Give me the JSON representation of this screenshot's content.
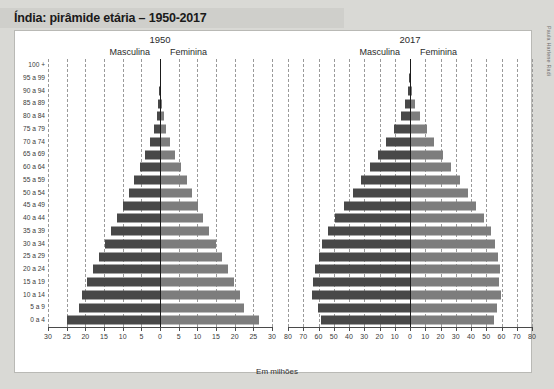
{
  "header": {
    "title": "Índia: pirâmide etária – 1950-2017"
  },
  "credit": "Paula Harlene Radi",
  "footer": {
    "unit_label": "Em milhões"
  },
  "labels": {
    "male": "Masculina",
    "female": "Feminina"
  },
  "colors": {
    "male_bar": "#484848",
    "female_bar": "#7d7d7d",
    "axis": "#1b1b1b",
    "grid": "#9a9a9a",
    "title_band": "#cfcfcb",
    "page_background": "#d9d9d5",
    "plot_background": "#ffffff"
  },
  "chart_data": [
    {
      "type": "bar",
      "title": "1950",
      "subtype": "population-pyramid",
      "xlabel": "Em milhões",
      "ylabel": "",
      "unit": "milhões",
      "xlim": [
        -30,
        30
      ],
      "xticks": [
        30,
        25,
        20,
        15,
        10,
        5,
        0,
        5,
        10,
        15,
        20,
        25,
        30
      ],
      "grid": true,
      "grid_orientation": "vertical",
      "legend_position": "top",
      "categories": [
        "100 +",
        "95 a 99",
        "90 a 94",
        "85 a 89",
        "80 a 84",
        "75 a 79",
        "70 a 74",
        "65 a 69",
        "60 a 64",
        "55 a 59",
        "50 a 54",
        "45 a 49",
        "40 a 44",
        "35 a 39",
        "30 a 34",
        "25 a 29",
        "20 a 24",
        "15 a 19",
        "10 a 14",
        "5 a 9",
        "0 a 4"
      ],
      "series": [
        {
          "name": "Masculina",
          "side": "left",
          "values": [
            0.02,
            0.08,
            0.2,
            0.45,
            0.9,
            1.6,
            2.6,
            3.9,
            5.3,
            6.9,
            8.4,
            9.9,
            11.4,
            13.0,
            14.6,
            16.3,
            18.0,
            19.6,
            21.0,
            21.6,
            25.0
          ]
        },
        {
          "name": "Feminina",
          "side": "right",
          "values": [
            0.02,
            0.09,
            0.22,
            0.5,
            1.0,
            1.7,
            2.8,
            4.1,
            5.5,
            7.1,
            8.6,
            10.1,
            11.6,
            13.2,
            14.9,
            16.6,
            18.3,
            19.9,
            21.4,
            22.4,
            26.4
          ]
        }
      ]
    },
    {
      "type": "bar",
      "title": "2017",
      "subtype": "population-pyramid",
      "xlabel": "Em milhões",
      "ylabel": "",
      "unit": "milhões",
      "xlim": [
        -80,
        80
      ],
      "xticks": [
        80,
        70,
        60,
        50,
        40,
        30,
        20,
        10,
        0,
        10,
        20,
        30,
        40,
        50,
        60,
        70,
        80
      ],
      "grid": true,
      "grid_orientation": "vertical",
      "legend_position": "top",
      "categories": [
        "100 +",
        "95 a 99",
        "90 a 94",
        "85 a 89",
        "80 a 84",
        "75 a 79",
        "70 a 74",
        "65 a 69",
        "60 a 64",
        "55 a 59",
        "50 a 54",
        "45 a 49",
        "40 a 44",
        "35 a 39",
        "30 a 34",
        "25 a 29",
        "20 a 24",
        "15 a 19",
        "10 a 14",
        "5 a 9",
        "0 a 4"
      ],
      "series": [
        {
          "name": "Masculina",
          "side": "left",
          "values": [
            0.1,
            0.5,
            1.3,
            3.0,
            6.0,
            10.5,
            15.5,
            21.0,
            26.5,
            32.0,
            37.5,
            43.5,
            49.0,
            54.0,
            57.5,
            60.0,
            62.0,
            63.5,
            64.0,
            60.5,
            58.5
          ]
        },
        {
          "name": "Feminina",
          "side": "right",
          "values": [
            0.1,
            0.6,
            1.5,
            3.3,
            6.5,
            11.0,
            16.0,
            21.5,
            27.0,
            32.5,
            38.0,
            43.5,
            48.5,
            53.0,
            56.0,
            58.0,
            59.0,
            58.5,
            59.5,
            57.0,
            55.0
          ]
        }
      ]
    }
  ]
}
